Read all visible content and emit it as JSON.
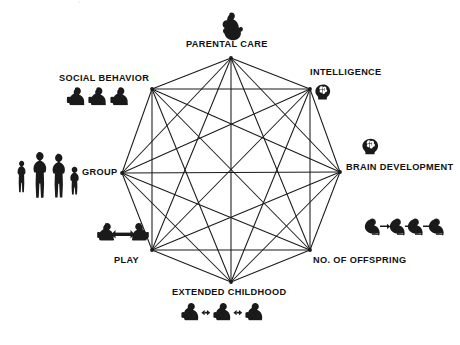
{
  "figure": {
    "type": "network-diagram",
    "shape": "octagon-complete-graph",
    "node_count": 8,
    "edge_style": "all-pairs",
    "line_color": "#1a1a1a",
    "background": "#ffffff",
    "top_edge_artifact": "|  ---"
  },
  "nodes": [
    {
      "id": "parental-care",
      "label": "PARENTAL CARE",
      "icon": "adult-holding-infant-icon",
      "vertex": {
        "x": 231,
        "y": 58
      },
      "label_pos": {
        "x": 186,
        "y": 40
      },
      "icon_pos": {
        "x": 219,
        "y": 12
      }
    },
    {
      "id": "intelligence",
      "label": "INTELLIGENCE",
      "icon": "head-with-brain-icon",
      "vertex": {
        "x": 310,
        "y": 89
      },
      "label_pos": {
        "x": 310,
        "y": 68
      },
      "icon_pos": {
        "x": 315,
        "y": 84
      }
    },
    {
      "id": "brain-development",
      "label": "BRAIN DEVELOPMENT",
      "icon": "head-with-brain-icon",
      "vertex": {
        "x": 340,
        "y": 172
      },
      "label_pos": {
        "x": 346,
        "y": 163
      },
      "icon_pos": {
        "x": 362,
        "y": 138
      }
    },
    {
      "id": "no-of-offspring",
      "label": "NO. OF OFFSPRING",
      "icon": "three-infants-with-arrows-icon",
      "vertex": {
        "x": 310,
        "y": 250
      },
      "label_pos": {
        "x": 313,
        "y": 256
      },
      "icon_pos": {
        "x": 364,
        "y": 216
      }
    },
    {
      "id": "extended-childhood",
      "label": "EXTENDED CHILDHOOD",
      "icon": "three-children-with-arrows-icon",
      "vertex": {
        "x": 231,
        "y": 282
      },
      "label_pos": {
        "x": 172,
        "y": 288
      },
      "icon_pos": {
        "x": 181,
        "y": 302
      }
    },
    {
      "id": "play",
      "label": "PLAY",
      "icon": "two-children-playing-icon",
      "vertex": {
        "x": 152,
        "y": 250
      },
      "label_pos": {
        "x": 114,
        "y": 256
      },
      "icon_pos": {
        "x": 95,
        "y": 222
      }
    },
    {
      "id": "group",
      "label": "GROUP",
      "icon": "family-group-icon",
      "vertex": {
        "x": 122,
        "y": 173
      },
      "label_pos": {
        "x": 82,
        "y": 168
      },
      "icon_pos": {
        "x": 12,
        "y": 148
      }
    },
    {
      "id": "social-behavior",
      "label": "SOCIAL BEHAVIOR",
      "icon": "three-seated-figures-icon",
      "vertex": {
        "x": 152,
        "y": 89
      },
      "label_pos": {
        "x": 59,
        "y": 74
      },
      "icon_pos": {
        "x": 66,
        "y": 86
      }
    }
  ]
}
